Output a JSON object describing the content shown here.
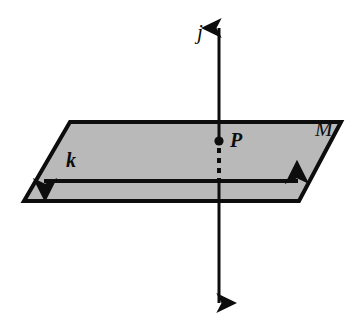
{
  "figure": {
    "type": "geometry-diagram",
    "background_color": "#ffffff",
    "ink_color": "#0d0d0d",
    "plane": {
      "name": "plane-M",
      "label": "M",
      "fill_color": "#b9b9b9",
      "stroke_color": "#0d0d0d",
      "stroke_width": 4,
      "vertices": [
        [
          70,
          122
        ],
        [
          341,
          122
        ],
        [
          299,
          201
        ],
        [
          24,
          201
        ]
      ],
      "label_position": [
        325,
        131
      ]
    },
    "line_j": {
      "name": "line-j",
      "label": "j",
      "orientation": "vertical",
      "double_arrow": true,
      "stroke_width": 3,
      "top_point": [
        219,
        22
      ],
      "bottom_point": [
        219,
        310
      ],
      "hidden_segment": {
        "from": [
          219,
          148
        ],
        "to": [
          219,
          182
        ],
        "style": "dashed",
        "dash_pattern": "5,5"
      },
      "label_position": [
        205,
        33
      ]
    },
    "line_k": {
      "name": "line-k",
      "label": "k",
      "orientation": "horizontal",
      "double_arrow": true,
      "stroke_width": 4,
      "left_point": [
        38,
        181
      ],
      "right_point": [
        304,
        181
      ],
      "label_position": [
        74,
        161
      ]
    },
    "point_P": {
      "name": "point-P",
      "label": "P",
      "position": [
        219,
        141
      ],
      "radius": 4.5,
      "fill_color": "#0d0d0d",
      "label_position": [
        239,
        141
      ]
    }
  }
}
